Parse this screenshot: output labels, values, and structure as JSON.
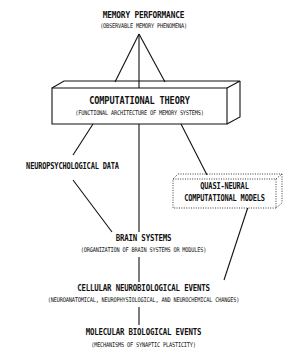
{
  "nodes": {
    "memory_performance": {
      "title": "MEMORY PERFORMANCE",
      "subtitle": "(OBSERVABLE MEMORY PHENOMENA)"
    },
    "computational_theory": {
      "title": "COMPUTATIONAL THEORY",
      "subtitle": "(FUNCTIONAL ARCHITECTURE OF MEMORY SYSTEMS)"
    },
    "neuropsychological_data": {
      "title": "NEUROPSYCHOLOGICAL DATA"
    },
    "quasi_neural_models": {
      "title_line1": "QUASI-NEURAL",
      "title_line2": "COMPUTATIONAL MODELS"
    },
    "brain_systems": {
      "title": "BRAIN SYSTEMS",
      "subtitle": "(ORGANIZATION OF BRAIN SYSTEMS OR MODULES)"
    },
    "cellular_events": {
      "title": "CELLULAR NEUROBIOLOGICAL EVENTS",
      "subtitle": "(NEUROANATOMICAL, NEUROPHYSIOLOGICAL, AND NEUROCHEMICAL CHANGES)"
    },
    "molecular_events": {
      "title": "MOLECULAR BIOLOGICAL EVENTS",
      "subtitle": "(MECHANISMS OF SYNAPTIC PLASTICITY)"
    }
  },
  "edges": [
    [
      "memory_performance",
      "computational_theory"
    ],
    [
      "computational_theory",
      "neuropsychological_data"
    ],
    [
      "computational_theory",
      "brain_systems"
    ],
    [
      "computational_theory",
      "quasi_neural_models"
    ],
    [
      "neuropsychological_data",
      "brain_systems"
    ],
    [
      "quasi_neural_models",
      "cellular_events"
    ],
    [
      "brain_systems",
      "cellular_events"
    ],
    [
      "cellular_events",
      "molecular_events"
    ]
  ]
}
